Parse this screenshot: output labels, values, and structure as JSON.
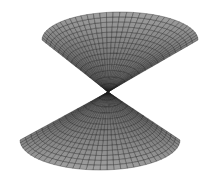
{
  "figure": {
    "title": "",
    "colors": {
      "background": "#ffffff",
      "face_light": "#a8a8a8",
      "face_dark": "#5a5a5a",
      "mesh_line": "#1a1a1a"
    },
    "surface": {
      "center": [
        108,
        92
      ],
      "upper_lobe": {
        "cx": 120,
        "cy": 40,
        "rx": 78,
        "ry": 28,
        "sweep_start": 180,
        "sweep_end": 360
      },
      "lower_lobe": {
        "cx": 100,
        "cy": 140,
        "rx": 80,
        "ry": 30,
        "sweep_start": 0,
        "sweep_end": 180
      },
      "radial_steps": 14,
      "angular_steps": 36
    }
  }
}
